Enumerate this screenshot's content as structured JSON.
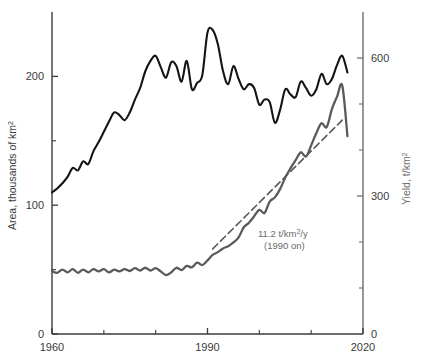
{
  "chart_data": {
    "type": "line",
    "title": "",
    "xlabel": "",
    "xlim": [
      1960,
      2020
    ],
    "x_ticks_labeled": [
      "1960",
      "1990",
      "2020"
    ],
    "x_tick_values": [
      1960,
      1990,
      2020
    ],
    "x_minor_ticks": [
      1970,
      1980,
      2000,
      2010
    ],
    "grid": false,
    "legend": "none",
    "axes": {
      "left": {
        "label": "Area, thousands of km",
        "label_superscript": "2",
        "ylim": [
          0,
          250
        ],
        "ticks_labeled": [
          "0",
          "100",
          "200"
        ],
        "tick_values": [
          0,
          100,
          200
        ],
        "minor_ticks": [
          50,
          150
        ],
        "color": "#222222"
      },
      "right": {
        "label": "Yield, t/km",
        "label_superscript": "2",
        "ylim": [
          0,
          700
        ],
        "ticks_labeled": [
          "0",
          "300",
          "600"
        ],
        "tick_values": [
          0,
          300,
          600
        ],
        "minor_ticks": [
          100,
          200,
          400,
          500
        ],
        "color": "#6e6e6e"
      }
    },
    "annotations": [
      {
        "name": "trend-rate-annotation",
        "line1_prefix": "11.2 t/km",
        "line1_superscript": "2",
        "line1_suffix": "/y",
        "line2": "(1990 on)",
        "color": "#6b6b6b"
      }
    ],
    "series": [
      {
        "name": "Area",
        "axis": "left",
        "color": "#141414",
        "style": "solid",
        "x": [
          1960,
          1961,
          1962,
          1963,
          1964,
          1965,
          1966,
          1967,
          1968,
          1969,
          1970,
          1971,
          1972,
          1973,
          1974,
          1975,
          1976,
          1977,
          1978,
          1979,
          1980,
          1981,
          1982,
          1983,
          1984,
          1985,
          1986,
          1987,
          1988,
          1989,
          1990,
          1991,
          1992,
          1993,
          1994,
          1995,
          1996,
          1997,
          1998,
          1999,
          2000,
          2001,
          2002,
          2003,
          2004,
          2005,
          2006,
          2007,
          2008,
          2009,
          2010,
          2011,
          2012,
          2013,
          2014,
          2015,
          2016,
          2017
        ],
        "values": [
          110,
          113,
          117,
          122,
          129,
          127,
          134,
          132,
          142,
          149,
          157,
          165,
          172,
          170,
          166,
          172,
          182,
          191,
          204,
          212,
          216,
          207,
          199,
          211,
          208,
          196,
          212,
          190,
          195,
          201,
          234,
          236,
          225,
          204,
          194,
          208,
          198,
          190,
          194,
          191,
          178,
          182,
          180,
          164,
          174,
          190,
          186,
          184,
          196,
          191,
          185,
          190,
          202,
          194,
          198,
          209,
          216,
          203
        ]
      },
      {
        "name": "Yield",
        "axis": "right",
        "color": "#5a5a5a",
        "style": "solid",
        "x": [
          1960,
          1961,
          1962,
          1963,
          1964,
          1965,
          1966,
          1967,
          1968,
          1969,
          1970,
          1971,
          1972,
          1973,
          1974,
          1975,
          1976,
          1977,
          1978,
          1979,
          1980,
          1981,
          1982,
          1983,
          1984,
          1985,
          1986,
          1987,
          1988,
          1989,
          1990,
          1991,
          1992,
          1993,
          1994,
          1995,
          1996,
          1997,
          1998,
          1999,
          2000,
          2001,
          2002,
          2003,
          2004,
          2005,
          2006,
          2007,
          2008,
          2009,
          2010,
          2011,
          2012,
          2013,
          2014,
          2015,
          2016,
          2017
        ],
        "values": [
          137,
          133,
          140,
          134,
          141,
          133,
          140,
          134,
          141,
          136,
          141,
          134,
          140,
          136,
          141,
          137,
          143,
          138,
          144,
          138,
          143,
          136,
          128,
          134,
          144,
          139,
          148,
          145,
          155,
          150,
          160,
          172,
          178,
          186,
          191,
          199,
          210,
          232,
          242,
          256,
          270,
          263,
          288,
          297,
          315,
          340,
          360,
          378,
          395,
          386,
          410,
          437,
          458,
          450,
          489,
          516,
          540,
          430
        ]
      },
      {
        "name": "Yield trend (1990 on)",
        "axis": "right",
        "color": "#5a5a5a",
        "style": "dashed",
        "x": [
          1991,
          2016
        ],
        "values": [
          185,
          465
        ]
      }
    ]
  }
}
